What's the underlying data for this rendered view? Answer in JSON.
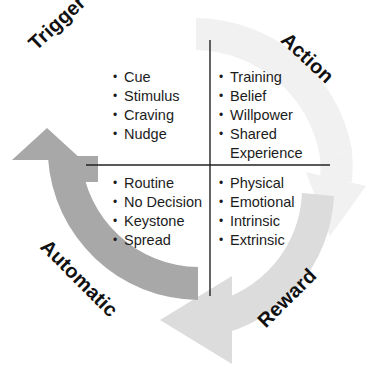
{
  "diagram": {
    "type": "circular-cycle",
    "colors": {
      "arc_dark": "#a8a8a8",
      "arc_light": "#dcdcdc",
      "arc_pale": "#f1f1f1",
      "divider": "#222222",
      "text": "#1c1c1c"
    },
    "quadrants": [
      {
        "id": "trigger",
        "label": "Trigger",
        "position": "top-left",
        "rotation_deg": -43,
        "items": [
          "Cue",
          "Stimulus",
          "Craving",
          "Nudge"
        ]
      },
      {
        "id": "action",
        "label": "Action",
        "position": "top-right",
        "rotation_deg": 43,
        "items": [
          "Training",
          "Belief",
          "Willpower",
          "Shared",
          "Experience"
        ]
      },
      {
        "id": "automatic",
        "label": "Automatic",
        "position": "bottom-left",
        "rotation_deg": 45,
        "items": [
          "Routine",
          "No Decision",
          "Keystone",
          "Spread"
        ]
      },
      {
        "id": "reward",
        "label": "Reward",
        "position": "bottom-right",
        "rotation_deg": -45,
        "items": [
          "Physical",
          "Emotional",
          "Intrinsic",
          "Extrinsic"
        ]
      }
    ],
    "arrows": [
      {
        "id": "arrow-up-left",
        "band": "automatic",
        "shade": "dark",
        "points": "up"
      },
      {
        "id": "arrow-down-right",
        "band": "action",
        "shade": "pale",
        "points": "down"
      },
      {
        "id": "arrow-left-bottom",
        "band": "reward",
        "shade": "light",
        "points": "left"
      }
    ]
  }
}
